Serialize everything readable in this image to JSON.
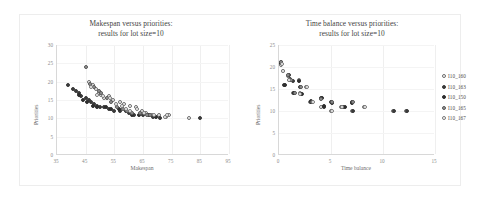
{
  "figure": {
    "background_color": "#ffffff",
    "frame_color": "#ededed"
  },
  "chart_data": [
    {
      "type": "scatter",
      "id": "makespan-vs-priorities",
      "title": "Makespan versus priorities:\nresults for lot size=10",
      "title_line1": "Makespan versus priorities:",
      "title_line2": "results for lot size=10",
      "xlabel": "Makespan",
      "ylabel": "Priorities",
      "xlim": [
        35,
        95
      ],
      "ylim": [
        0,
        30
      ],
      "xticks": [
        35,
        45,
        55,
        65,
        75,
        85,
        95
      ],
      "xtick_labels": [
        "35",
        "45",
        "55",
        "65",
        "75",
        "85",
        "95"
      ],
      "yticks": [
        0,
        5,
        10,
        15,
        20,
        25,
        30
      ],
      "ytick_labels": [
        "0",
        "5",
        "10",
        "15",
        "20",
        "25",
        "30"
      ],
      "grid": true,
      "legend": false,
      "series": [
        {
          "name": "I10_160",
          "marker": "open",
          "points": [
            [
              46.0,
              20.0
            ],
            [
              47.5,
              19.0
            ],
            [
              48.5,
              18.0
            ],
            [
              49.5,
              17.0
            ],
            [
              50.5,
              16.5
            ],
            [
              51.5,
              15.5
            ],
            [
              53.0,
              16.0
            ],
            [
              54.5,
              15.0
            ],
            [
              57.0,
              14.5
            ],
            [
              58.5,
              14.0
            ],
            [
              60.5,
              13.5
            ],
            [
              62.5,
              13.0
            ],
            [
              64.5,
              12.0
            ],
            [
              66.0,
              11.5
            ],
            [
              68.0,
              11.0
            ],
            [
              70.5,
              11.0
            ],
            [
              73.0,
              10.5
            ],
            [
              74.0,
              11.0
            ],
            [
              81.0,
              10.0
            ]
          ]
        },
        {
          "name": "I10_163",
          "marker": "filled",
          "points": [
            [
              39.0,
              19.0
            ],
            [
              40.5,
              18.0
            ],
            [
              41.5,
              17.5
            ],
            [
              42.5,
              17.0
            ],
            [
              43.5,
              16.0
            ],
            [
              45.0,
              15.5
            ],
            [
              46.0,
              15.0
            ],
            [
              47.0,
              14.5
            ],
            [
              48.0,
              14.0
            ],
            [
              49.0,
              13.5
            ],
            [
              50.0,
              13.0
            ],
            [
              51.5,
              13.0
            ],
            [
              53.0,
              12.5
            ],
            [
              55.0,
              12.0
            ],
            [
              57.0,
              12.0
            ],
            [
              60.0,
              11.5
            ],
            [
              62.0,
              11.0
            ],
            [
              65.0,
              11.0
            ],
            [
              68.5,
              10.5
            ],
            [
              71.0,
              10.0
            ],
            [
              85.0,
              10.0
            ]
          ]
        },
        {
          "name": "I10_150",
          "marker": "dark",
          "points": [
            [
              42.5,
              16.5
            ],
            [
              44.0,
              15.0
            ],
            [
              45.5,
              14.5
            ],
            [
              47.5,
              13.5
            ],
            [
              49.0,
              13.0
            ],
            [
              52.0,
              13.0
            ],
            [
              54.0,
              12.5
            ],
            [
              56.5,
              12.5
            ],
            [
              59.0,
              12.0
            ],
            [
              61.0,
              11.0
            ],
            [
              63.5,
              11.0
            ],
            [
              67.0,
              11.0
            ],
            [
              69.5,
              10.5
            ]
          ]
        },
        {
          "name": "I10_165",
          "marker": "half",
          "points": [
            [
              45.0,
              24.0
            ],
            [
              46.5,
              19.5
            ],
            [
              48.0,
              18.5
            ],
            [
              49.5,
              17.5
            ],
            [
              50.5,
              17.0
            ],
            [
              52.5,
              15.5
            ],
            [
              54.0,
              14.5
            ],
            [
              56.0,
              13.0
            ],
            [
              58.0,
              12.5
            ],
            [
              59.5,
              12.0
            ],
            [
              61.0,
              11.5
            ],
            [
              64.0,
              11.5
            ],
            [
              66.5,
              11.0
            ],
            [
              67.5,
              11.0
            ]
          ]
        },
        {
          "name": "I10_167",
          "marker": "ring",
          "points": [
            [
              47.0,
              18.5
            ],
            [
              49.0,
              16.5
            ],
            [
              51.0,
              16.0
            ],
            [
              53.5,
              15.5
            ],
            [
              55.5,
              14.0
            ],
            [
              57.5,
              13.5
            ],
            [
              59.0,
              12.5
            ],
            [
              60.5,
              12.0
            ],
            [
              63.0,
              12.5
            ],
            [
              65.5,
              11.5
            ],
            [
              69.0,
              11.0
            ],
            [
              72.5,
              10.5
            ],
            [
              73.5,
              11.0
            ]
          ]
        }
      ]
    },
    {
      "type": "scatter",
      "id": "time-balance-vs-priorities",
      "title": "Time balance versus priorities:\nresults for lot size=10",
      "title_line1": "Time balance versus priorities:",
      "title_line2": "results for lot size=10",
      "xlabel": "Time balance",
      "ylabel": "Priorities",
      "xlim": [
        0,
        15
      ],
      "ylim": [
        0,
        25
      ],
      "xticks": [
        0,
        5,
        10,
        15
      ],
      "xtick_labels": [
        "0",
        "5",
        "10",
        "15"
      ],
      "yticks": [
        0,
        5,
        10,
        15,
        20,
        25
      ],
      "ytick_labels": [
        "0",
        "5",
        "10",
        "15",
        "20",
        "25"
      ],
      "grid": true,
      "legend": true,
      "legend_position": "right",
      "series": [
        {
          "name": "I10_160",
          "marker": "open",
          "points": [
            [
              0.15,
              21.0
            ],
            [
              0.2,
              20.5
            ],
            [
              0.35,
              19.0
            ],
            [
              0.9,
              18.0
            ],
            [
              1.0,
              17.0
            ],
            [
              1.35,
              14.0
            ],
            [
              1.9,
              17.0
            ],
            [
              2.0,
              14.0
            ],
            [
              2.6,
              15.5
            ],
            [
              3.0,
              12.0
            ],
            [
              3.2,
              12.0
            ],
            [
              4.0,
              11.0
            ],
            [
              5.0,
              10.0
            ],
            [
              6.0,
              11.0
            ],
            [
              7.0,
              10.0
            ],
            [
              8.2,
              11.0
            ],
            [
              11.0,
              10.0
            ],
            [
              12.2,
              10.0
            ]
          ]
        },
        {
          "name": "I10_163",
          "marker": "filled",
          "points": [
            [
              0.15,
              21.2
            ],
            [
              0.2,
              20.8
            ],
            [
              0.5,
              16.0
            ],
            [
              0.95,
              18.2
            ],
            [
              1.1,
              17.2
            ],
            [
              1.3,
              16.8
            ],
            [
              1.45,
              14.2
            ],
            [
              2.05,
              15.5
            ],
            [
              2.2,
              13.8
            ],
            [
              3.05,
              12.2
            ],
            [
              4.0,
              13.0
            ],
            [
              4.3,
              11.0
            ],
            [
              5.0,
              12.0
            ],
            [
              6.2,
              11.0
            ],
            [
              7.0,
              12.0
            ],
            [
              7.1,
              10.0
            ],
            [
              11.1,
              10.0
            ],
            [
              12.3,
              10.0
            ]
          ]
        },
        {
          "name": "I10_150",
          "marker": "dark",
          "points": [
            [
              0.2,
              20.9
            ],
            [
              0.55,
              15.9
            ],
            [
              1.05,
              17.1
            ],
            [
              1.4,
              14.1
            ],
            [
              1.95,
              16.9
            ],
            [
              2.15,
              13.9
            ],
            [
              3.1,
              12.1
            ],
            [
              4.1,
              12.9
            ],
            [
              4.35,
              11.1
            ],
            [
              5.1,
              11.9
            ],
            [
              6.3,
              10.9
            ],
            [
              7.05,
              11.9
            ]
          ]
        },
        {
          "name": "I10_165",
          "marker": "half",
          "points": [
            [
              0.18,
              21.1
            ],
            [
              0.9,
              18.1
            ],
            [
              1.15,
              17.1
            ],
            [
              1.5,
              14.1
            ],
            [
              2.1,
              15.4
            ],
            [
              3.15,
              12.1
            ],
            [
              4.05,
              12.8
            ],
            [
              5.05,
              11.95
            ],
            [
              6.1,
              10.95
            ],
            [
              7.15,
              11.95
            ]
          ]
        },
        {
          "name": "I10_167",
          "marker": "ring",
          "points": [
            [
              0.25,
              20.6
            ],
            [
              0.4,
              19.0
            ],
            [
              1.0,
              17.0
            ],
            [
              2.05,
              13.9
            ],
            [
              2.65,
              15.5
            ],
            [
              3.25,
              12.0
            ],
            [
              5.05,
              10.0
            ],
            [
              6.05,
              11.0
            ],
            [
              8.25,
              11.0
            ]
          ]
        }
      ],
      "legend_entries": [
        {
          "label": "I10_160",
          "marker": "open"
        },
        {
          "label": "I10_163",
          "marker": "filled"
        },
        {
          "label": "I10_150",
          "marker": "dark"
        },
        {
          "label": "I10_165",
          "marker": "half"
        },
        {
          "label": "I10_167",
          "marker": "ring"
        }
      ]
    }
  ]
}
